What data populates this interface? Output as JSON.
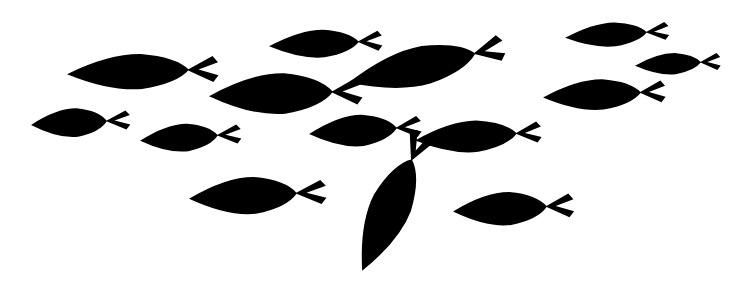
{
  "artwork": {
    "title": "School of Fish Silhouette",
    "subject": "fish-school",
    "width": 744,
    "height": 293,
    "background_color": "#ffffff",
    "silhouette_color": "#000000",
    "fish_count": 14,
    "style": "flat-silhouette-clipart"
  },
  "fish": [
    {
      "id": "fish-top-left-large",
      "label": "Large fish upper left",
      "cx": 128,
      "cy": 72,
      "body_length": 122,
      "body_height": 38,
      "tail_length": 24,
      "tail_height": 26,
      "rotation": -2,
      "color": "#000000"
    },
    {
      "id": "fish-top-center-small",
      "label": "Small fish top center",
      "cx": 314,
      "cy": 44,
      "body_length": 90,
      "body_height": 30,
      "tail_length": 19,
      "tail_height": 20,
      "rotation": -3,
      "color": "#000000"
    },
    {
      "id": "fish-top-right-medium",
      "label": "Medium fish top right",
      "cx": 606,
      "cy": 35,
      "body_length": 82,
      "body_height": 26,
      "tail_length": 18,
      "tail_height": 18,
      "rotation": -4,
      "color": "#000000"
    },
    {
      "id": "fish-right-edge-small",
      "label": "Small fish right edge",
      "cx": 668,
      "cy": 64,
      "body_length": 66,
      "body_height": 23,
      "tail_length": 16,
      "tail_height": 17,
      "rotation": -3,
      "color": "#000000"
    },
    {
      "id": "fish-right-mid",
      "label": "Fish mid right",
      "cx": 592,
      "cy": 95,
      "body_length": 98,
      "body_height": 33,
      "tail_length": 20,
      "tail_height": 22,
      "rotation": -3,
      "color": "#000000"
    },
    {
      "id": "fish-center-tilted-large",
      "label": "Large tilted fish center",
      "cx": 412,
      "cy": 68,
      "body_length": 130,
      "body_height": 42,
      "tail_length": 24,
      "tail_height": 26,
      "rotation": -13,
      "color": "#000000"
    },
    {
      "id": "fish-upper-mid-large",
      "label": "Large fish upper middle",
      "cx": 271,
      "cy": 94,
      "body_length": 124,
      "body_height": 44,
      "tail_length": 24,
      "tail_height": 27,
      "rotation": -2,
      "color": "#000000"
    },
    {
      "id": "fish-left-small",
      "label": "Small fish left",
      "cx": 69,
      "cy": 123,
      "body_length": 76,
      "body_height": 31,
      "tail_length": 19,
      "tail_height": 19,
      "rotation": -3,
      "color": "#000000"
    },
    {
      "id": "fish-left-lower-small",
      "label": "Small fish lower left",
      "cx": 179,
      "cy": 138,
      "body_length": 78,
      "body_height": 30,
      "tail_length": 19,
      "tail_height": 19,
      "rotation": -4,
      "color": "#000000"
    },
    {
      "id": "fish-center-mid",
      "label": "Fish center middle",
      "cx": 353,
      "cy": 131,
      "body_length": 88,
      "body_height": 34,
      "tail_length": 20,
      "tail_height": 21,
      "rotation": -4,
      "color": "#000000"
    },
    {
      "id": "fish-center-right-mid",
      "label": "Fish center right middle",
      "cx": 466,
      "cy": 137,
      "body_length": 102,
      "body_height": 34,
      "tail_length": 20,
      "tail_height": 21,
      "rotation": -4,
      "color": "#000000"
    },
    {
      "id": "fish-bottom-left-large",
      "label": "Large fish bottom left",
      "cx": 243,
      "cy": 196,
      "body_length": 108,
      "body_height": 40,
      "tail_length": 24,
      "tail_height": 24,
      "rotation": -3,
      "color": "#000000"
    },
    {
      "id": "fish-bottom-vertical",
      "label": "Vertical rising fish bottom center",
      "cx": 387,
      "cy": 215,
      "body_length": 122,
      "body_height": 44,
      "tail_length": 24,
      "tail_height": 26,
      "rotation": -66,
      "color": "#000000"
    },
    {
      "id": "fish-bottom-right",
      "label": "Fish bottom right",
      "cx": 500,
      "cy": 209,
      "body_length": 94,
      "body_height": 36,
      "tail_length": 22,
      "tail_height": 24,
      "rotation": -3,
      "color": "#000000"
    }
  ]
}
